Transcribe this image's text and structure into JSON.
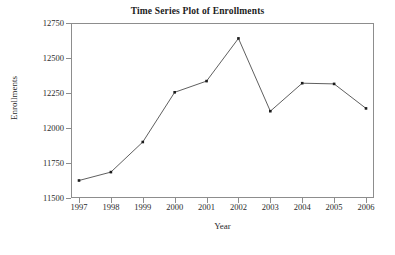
{
  "chart_data": {
    "type": "line",
    "title": "Time Series Plot of Enrollments",
    "xlabel": "Year",
    "ylabel": "Enrollments",
    "categories": [
      1997,
      1998,
      1999,
      2000,
      2001,
      2002,
      2003,
      2004,
      2005,
      2006
    ],
    "x_tick_labels": [
      "1997",
      "1998",
      "1999",
      "2000",
      "2001",
      "2002",
      "2003",
      "2004",
      "2005",
      "2006"
    ],
    "values": [
      11625,
      11685,
      11900,
      12255,
      12335,
      12640,
      12120,
      12320,
      12315,
      12140
    ],
    "series": [
      {
        "name": "Enrollments",
        "values": [
          11625,
          11685,
          11900,
          12255,
          12335,
          12640,
          12120,
          12320,
          12315,
          12140
        ]
      }
    ],
    "xlim": [
      1997,
      2006
    ],
    "ylim": [
      11500,
      12750
    ],
    "y_ticks": [
      11500,
      11750,
      12000,
      12250,
      12500,
      12750
    ],
    "y_tick_labels": [
      "11500",
      "11750",
      "12000",
      "12250",
      "12500",
      "12750"
    ],
    "grid": false,
    "legend": false,
    "legend_position": "none",
    "marker": "square",
    "line_color": "#4d4d4d",
    "marker_color": "#1c1c1c",
    "frame_color": "#8d8d8d",
    "background_color": "#ffffff"
  }
}
